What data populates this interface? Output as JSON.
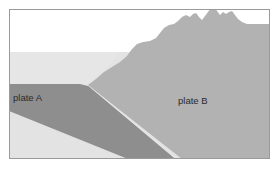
{
  "figure": {
    "type": "geological-cross-section",
    "width": 278,
    "height": 169,
    "background_color": "#ffffff"
  },
  "colors": {
    "sky": "#ffffff",
    "water": "#e6e6e6",
    "mantle": "#e3e3e3",
    "plate_a": "#8e8e8e",
    "plate_b": "#b2b2b2",
    "border": "#9a9a9a",
    "label": "#2b2b2b"
  },
  "labels": {
    "plate_a": "plate A",
    "plate_b": "plate B"
  },
  "label_positions": {
    "plate_a": {
      "x": 13,
      "y": 101
    },
    "plate_b": {
      "x": 178,
      "y": 104
    }
  },
  "regions": {
    "sky": {
      "name": "sky",
      "description": "white region above sea level, upper-left"
    },
    "water": {
      "name": "ocean-water",
      "description": "light grey band above oceanic plate A"
    },
    "mantle": {
      "name": "mantle",
      "description": "light grey region beneath the plates"
    },
    "plate_a": {
      "name": "plate-A-slab",
      "description": "dark grey oceanic plate subducting to the right and downward"
    },
    "plate_b": {
      "name": "plate-B-continent",
      "description": "medium grey overriding continental plate with mountain range"
    }
  },
  "geometry": {
    "frame": {
      "x": 9,
      "y": 9,
      "width": 261,
      "height": 150
    },
    "sea_level_y": 52,
    "plate_a_top_y": 84,
    "plate_a_bottom_y": 111,
    "trench_x": 88,
    "mountain_peaks": [
      {
        "x": 196,
        "y": 13
      },
      {
        "x": 214,
        "y": 6
      },
      {
        "x": 232,
        "y": 11
      }
    ]
  }
}
